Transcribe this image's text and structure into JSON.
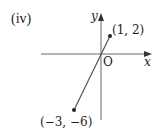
{
  "part_label": "(iv)",
  "axes": {
    "x_label": "x",
    "y_label": "y",
    "origin_label": "O"
  },
  "points": [
    {
      "label": "(1, 2)",
      "x": 1,
      "y": 2
    },
    {
      "label": "(−3, −6)",
      "x": -3,
      "y": -6
    }
  ],
  "line": {
    "from": "(-3, -6)",
    "to": "(1, 2)",
    "passes_through_origin": true
  },
  "colors": {
    "line": "#555555",
    "axis": "#555555",
    "point": "#222222",
    "text": "#222222"
  }
}
